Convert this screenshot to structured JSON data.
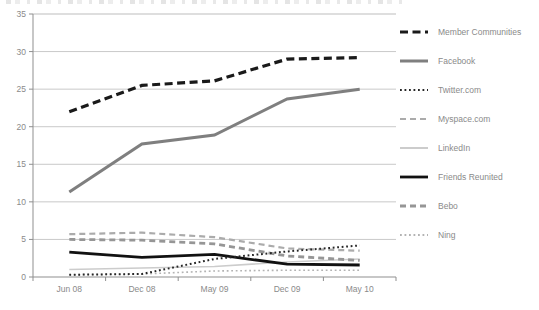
{
  "colors": {
    "background": "#ffffff",
    "grid": "#c9c9c9",
    "plot_border_top": "#bdbdbd",
    "axis": "#8f8f8f",
    "tick_label": "#8a8a8a",
    "legend_text": "#8a8a8a"
  },
  "chart_data": {
    "type": "line",
    "categories": [
      "Jun 08",
      "Dec 08",
      "May 09",
      "Dec 09",
      "May 10"
    ],
    "y_axis": {
      "min": 0,
      "max": 35,
      "step": 5,
      "tick_labels": [
        "0",
        "5",
        "10",
        "15",
        "20",
        "25",
        "30",
        "35"
      ]
    },
    "grid": true,
    "legend_position": "right",
    "series": [
      {
        "name": "Member Communities",
        "color": "#1a1a1a",
        "style": "dashed",
        "width": 3.2,
        "values": [
          22,
          25.5,
          26.1,
          29,
          29.2
        ]
      },
      {
        "name": "Facebook",
        "color": "#7f7f7f",
        "style": "solid",
        "width": 3.0,
        "values": [
          11.3,
          17.7,
          18.9,
          23.7,
          25
        ]
      },
      {
        "name": "Twitter.com",
        "color": "#262626",
        "style": "dotted",
        "width": 2.0,
        "values": [
          0.3,
          0.4,
          2.4,
          3.4,
          4.2
        ]
      },
      {
        "name": "Myspace.com",
        "color": "#ababab",
        "style": "dashed",
        "width": 2.2,
        "values": [
          5.7,
          5.9,
          5.3,
          3.8,
          3.5
        ]
      },
      {
        "name": "LinkedIn",
        "color": "#cccccc",
        "style": "solid",
        "width": 1.6,
        "values": [
          1.0,
          1.2,
          1.4,
          2.0,
          2.4
        ]
      },
      {
        "name": "Friends Reunited",
        "color": "#111111",
        "style": "solid",
        "width": 2.8,
        "values": [
          3.3,
          2.6,
          3.0,
          1.7,
          1.6
        ]
      },
      {
        "name": "Bebo",
        "color": "#969696",
        "style": "dashed",
        "width": 2.8,
        "values": [
          5.0,
          4.9,
          4.4,
          2.8,
          2.2
        ]
      },
      {
        "name": "Ning",
        "color": "#b3b3b3",
        "style": "dotted",
        "width": 1.6,
        "values": [
          0.3,
          0.4,
          0.8,
          0.9,
          0.9
        ]
      }
    ],
    "draw_order": [
      "LinkedIn",
      "Ning",
      "Myspace.com",
      "Bebo",
      "Facebook",
      "Friends Reunited",
      "Twitter.com",
      "Member Communities"
    ]
  }
}
